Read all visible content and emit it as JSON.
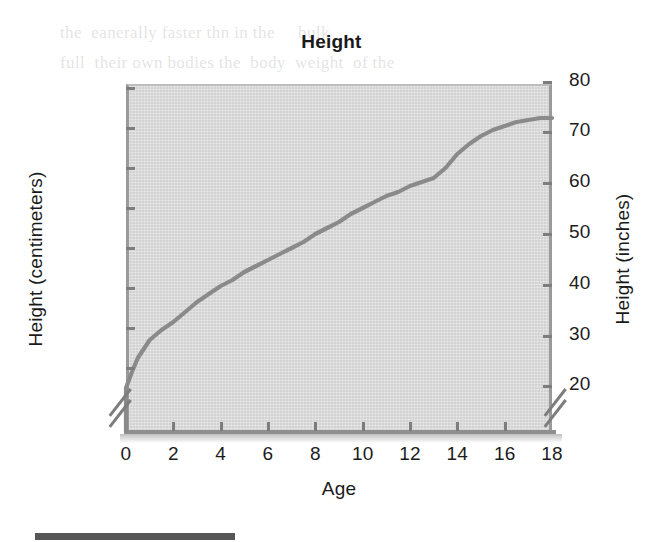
{
  "page": {
    "ghost_text": "the  eanerally faster thn in the     bulk\nfull  their own bodies the  body  weight  of the\n",
    "artifact_bar": "page-edge-bar"
  },
  "chart_data": {
    "type": "line",
    "title": "Height",
    "xlabel": "Age",
    "ylabel": "Height (centimeters)",
    "ylabel_right": "Height (inches)",
    "xlim": [
      0,
      18
    ],
    "ylim": [
      45,
      205
    ],
    "ylim_right": [
      17.7,
      80.7
    ],
    "grid": false,
    "legend": "none",
    "axis_break_left": true,
    "axis_break_right": true,
    "line_color": "#8a8a8a",
    "plot_background": "#d2d2d2",
    "xticks": [
      "0",
      "2",
      "4",
      "6",
      "8",
      "10",
      "12",
      "14",
      "16",
      "18"
    ],
    "xtick_values": [
      0,
      2,
      4,
      6,
      8,
      10,
      12,
      14,
      16,
      18
    ],
    "yticks_left": [
      "200",
      "180",
      "160",
      "140",
      "120",
      "100",
      "80",
      "60"
    ],
    "ytick_values_left": [
      200,
      180,
      160,
      140,
      120,
      100,
      80,
      60
    ],
    "yticks_right": [
      "80",
      "70",
      "60",
      "50",
      "40",
      "30",
      "20"
    ],
    "ytick_values_right": [
      80,
      70,
      60,
      50,
      40,
      30,
      20
    ],
    "x": [
      0,
      0.25,
      0.5,
      1,
      1.5,
      2,
      2.5,
      3,
      3.5,
      4,
      4.5,
      5,
      5.5,
      6,
      6.5,
      7,
      7.5,
      8,
      8.5,
      9,
      9.5,
      10,
      10.5,
      11,
      11.5,
      12,
      12.5,
      13,
      13.5,
      14,
      14.5,
      15,
      15.5,
      16,
      16.5,
      17,
      17.5,
      18
    ],
    "values": [
      50,
      58,
      65,
      74,
      79,
      83,
      88,
      93,
      97,
      101,
      104,
      108,
      111,
      114,
      117,
      120,
      123,
      127,
      130,
      133,
      137,
      140,
      143,
      146,
      148,
      151,
      153,
      155,
      160,
      167,
      172,
      176,
      179,
      181,
      183,
      184,
      185,
      185
    ],
    "series": [
      {
        "name": "Height",
        "unit": "centimeters",
        "values": [
          50,
          58,
          65,
          74,
          79,
          83,
          88,
          93,
          97,
          101,
          104,
          108,
          111,
          114,
          117,
          120,
          123,
          127,
          130,
          133,
          137,
          140,
          143,
          146,
          148,
          151,
          153,
          155,
          160,
          167,
          172,
          176,
          179,
          181,
          183,
          184,
          185,
          185
        ]
      }
    ]
  }
}
